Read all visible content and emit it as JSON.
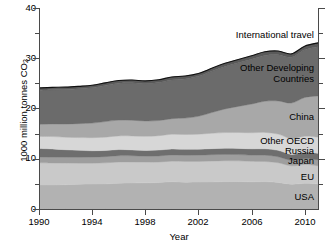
{
  "chart_data": {
    "type": "area",
    "stacked": true,
    "title": "",
    "xlabel": "Year",
    "ylabel": "1000 million tonnes CO2",
    "ylabel_display": "1000 million tonnes CO",
    "ylabel_sub": "2",
    "xlim": [
      1990,
      2011
    ],
    "ylim": [
      0,
      40
    ],
    "ytick_values": [
      0,
      10,
      20,
      30,
      40
    ],
    "ytick_labels": [
      "0",
      "10",
      "20",
      "30",
      "40"
    ],
    "ytick_minor_values": [
      5,
      15,
      25,
      35
    ],
    "xtick_values": [
      1990,
      1994,
      1998,
      2002,
      2006,
      2010
    ],
    "xtick_labels": [
      "1990",
      "1994",
      "1998",
      "2002",
      "2006",
      "2010"
    ],
    "grid": false,
    "legend_position": "in-plot-right",
    "x": [
      1990,
      1991,
      1992,
      1993,
      1994,
      1995,
      1996,
      1997,
      1998,
      1999,
      2000,
      2001,
      2002,
      2003,
      2004,
      2005,
      2006,
      2007,
      2008,
      2009,
      2010,
      2011
    ],
    "series": [
      {
        "name": "USA",
        "color": "#b2b2b2",
        "values": [
          4.8,
          4.78,
          4.85,
          4.92,
          4.96,
          5.0,
          5.12,
          5.18,
          5.2,
          5.26,
          5.42,
          5.33,
          5.35,
          5.38,
          5.45,
          5.46,
          5.4,
          5.45,
          5.28,
          4.95,
          5.1,
          5.0
        ]
      },
      {
        "name": "EU",
        "color": "#c9c9c9",
        "values": [
          4.4,
          4.38,
          4.28,
          4.2,
          4.16,
          4.18,
          4.24,
          4.18,
          4.14,
          4.08,
          4.1,
          4.14,
          4.12,
          4.16,
          4.16,
          4.12,
          4.08,
          4.0,
          3.92,
          3.64,
          3.76,
          3.6
        ]
      },
      {
        "name": "Japan",
        "color": "#9e9e9e",
        "values": [
          1.15,
          1.17,
          1.18,
          1.17,
          1.22,
          1.24,
          1.25,
          1.24,
          1.18,
          1.22,
          1.24,
          1.22,
          1.25,
          1.27,
          1.26,
          1.25,
          1.23,
          1.27,
          1.2,
          1.1,
          1.16,
          1.19
        ]
      },
      {
        "name": "Russia",
        "color": "#6e6e6e",
        "values": [
          1.7,
          1.62,
          1.48,
          1.38,
          1.25,
          1.22,
          1.22,
          1.16,
          1.14,
          1.16,
          1.18,
          1.18,
          1.17,
          1.2,
          1.22,
          1.23,
          1.26,
          1.26,
          1.27,
          1.18,
          1.25,
          1.28
        ]
      },
      {
        "name": "Other OECD",
        "color": "#d7d7d7",
        "values": [
          2.4,
          2.46,
          2.5,
          2.54,
          2.6,
          2.66,
          2.72,
          2.78,
          2.8,
          2.86,
          2.94,
          2.96,
          3.0,
          3.06,
          3.12,
          3.16,
          3.2,
          3.26,
          3.24,
          3.12,
          3.22,
          3.24
        ]
      },
      {
        "name": "China",
        "color": "#a8a8a8",
        "values": [
          2.4,
          2.52,
          2.62,
          2.78,
          2.9,
          3.1,
          3.14,
          3.12,
          3.06,
          3.02,
          3.1,
          3.26,
          3.56,
          4.12,
          4.7,
          5.2,
          5.72,
          6.22,
          6.6,
          7.1,
          7.7,
          8.2
        ]
      },
      {
        "name": "Other Developing Countries",
        "color": "#6b6b6b",
        "values": [
          6.8,
          6.82,
          6.88,
          6.96,
          7.05,
          7.2,
          7.35,
          7.46,
          7.42,
          7.55,
          7.7,
          7.8,
          7.95,
          8.2,
          8.45,
          8.66,
          8.9,
          9.1,
          9.2,
          9.1,
          9.5,
          9.8
        ]
      },
      {
        "name": "International travel",
        "color": "#5a5a5a",
        "values": [
          0.45,
          0.45,
          0.46,
          0.46,
          0.48,
          0.5,
          0.52,
          0.54,
          0.55,
          0.57,
          0.6,
          0.58,
          0.58,
          0.6,
          0.64,
          0.66,
          0.7,
          0.72,
          0.72,
          0.68,
          0.72,
          0.75
        ]
      }
    ],
    "series_labels": [
      {
        "name": "International travel",
        "text": "International travel",
        "lines": [
          "International travel"
        ]
      },
      {
        "name": "Other Developing Countries",
        "text": "Other Developing Countries",
        "lines": [
          "Other Developing",
          "Countries"
        ]
      },
      {
        "name": "China",
        "text": "China",
        "lines": [
          "China"
        ]
      },
      {
        "name": "Other OECD",
        "text": "Other OECD",
        "lines": [
          "Other OECD"
        ]
      },
      {
        "name": "Russia",
        "text": "Russia",
        "lines": [
          "Russia"
        ]
      },
      {
        "name": "Japan",
        "text": "Japan",
        "lines": [
          "Japan"
        ]
      },
      {
        "name": "EU",
        "text": "EU",
        "lines": [
          "EU"
        ]
      },
      {
        "name": "USA",
        "text": "USA",
        "lines": [
          "USA"
        ]
      }
    ],
    "outline_color": "#111111",
    "axis_color": "#4a4a4a",
    "background": "#ffffff"
  },
  "labels": {
    "international_travel": "International travel",
    "other_developing_1": "Other Developing",
    "other_developing_2": "Countries",
    "china": "China",
    "other_oecd": "Other OECD",
    "russia": "Russia",
    "japan": "Japan",
    "eu": "EU",
    "usa": "USA",
    "y_axis": "1000 million tonnes CO",
    "y_axis_sub": "2",
    "x_axis": "Year",
    "y0": "0",
    "y10": "10",
    "y20": "20",
    "y30": "30",
    "y40": "40",
    "x1990": "1990",
    "x1994": "1994",
    "x1998": "1998",
    "x2002": "2002",
    "x2006": "2006",
    "x2010": "2010"
  }
}
